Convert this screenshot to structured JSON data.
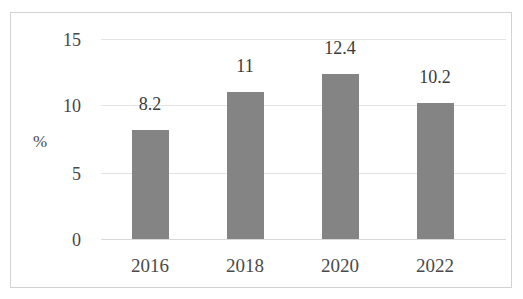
{
  "top_sliver": {
    "text": "——   ———   ——   ————   ——"
  },
  "colors": {
    "bar": "#848484",
    "gridline": "#e3e3e3",
    "frame_border": "#d2d2d2",
    "text": "#474747",
    "background": "#ffffff"
  },
  "chart_data": {
    "type": "bar",
    "title": "",
    "subtitle": "",
    "xlabel": "",
    "ylabel": "%",
    "categories": [
      "2016",
      "2018",
      "2020",
      "2022"
    ],
    "values": [
      8.2,
      11,
      12.4,
      10.2
    ],
    "data_labels": [
      "8.2",
      "11",
      "12.4",
      "10.2"
    ],
    "ylim": [
      0,
      15
    ],
    "yticks": [
      0,
      5,
      10,
      15
    ],
    "ytick_labels": [
      "0",
      "5",
      "10",
      "15"
    ],
    "grid": true,
    "legend": false,
    "legend_position": "none",
    "series": [
      {
        "name": "",
        "values": [
          8.2,
          11,
          12.4,
          10.2
        ],
        "color": "#848484"
      }
    ]
  }
}
